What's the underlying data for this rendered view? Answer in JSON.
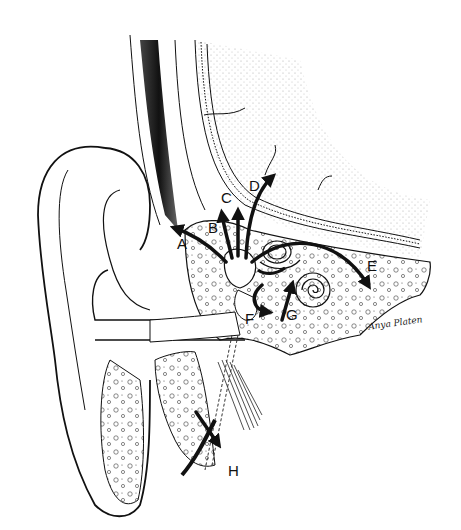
{
  "figure": {
    "labels": [
      {
        "id": "A",
        "text": "A",
        "x": 177,
        "y": 236
      },
      {
        "id": "B",
        "text": "B",
        "x": 208,
        "y": 220
      },
      {
        "id": "C",
        "text": "C",
        "x": 221,
        "y": 190
      },
      {
        "id": "D",
        "text": "D",
        "x": 249,
        "y": 178
      },
      {
        "id": "E",
        "text": "E",
        "x": 367,
        "y": 258
      },
      {
        "id": "F",
        "text": "F",
        "x": 245,
        "y": 311
      },
      {
        "id": "G",
        "text": "G",
        "x": 286,
        "y": 307
      },
      {
        "id": "H",
        "text": "H",
        "x": 228,
        "y": 463
      }
    ],
    "signature": "Anya Platen",
    "colors": {
      "ink": "#111111",
      "background": "#ffffff",
      "stipple": "#888888"
    }
  }
}
